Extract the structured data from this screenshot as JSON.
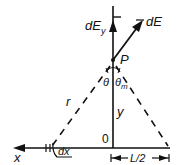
{
  "diagram": {
    "type": "physics-electric-field-line-charge",
    "labels": {
      "dEy": "dE",
      "dEy_sub": "y",
      "dE": "dE",
      "point": "P",
      "theta": "θ",
      "theta_m": "θ",
      "theta_m_sub": "m",
      "r": "r",
      "y": "y",
      "origin": "0",
      "x": "x",
      "dx": "dx",
      "half_length": "L/2"
    },
    "colors": {
      "stroke": "#111111",
      "background": "#ffffff"
    }
  }
}
